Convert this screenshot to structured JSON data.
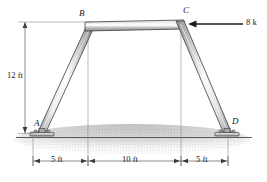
{
  "figure": {
    "joints": [
      {
        "id": "A",
        "label": "A",
        "x": 41,
        "y": 133
      },
      {
        "id": "B",
        "label": "B",
        "x": 88,
        "y": 24
      },
      {
        "id": "C",
        "label": "C",
        "x": 181,
        "y": 22
      },
      {
        "id": "D",
        "label": "D",
        "x": 228,
        "y": 133
      }
    ],
    "load": {
      "label": "8 k",
      "magnitude": 8,
      "unit": "k",
      "direction": "left",
      "applied_at": "C",
      "arrow_tail_x": 243,
      "arrow_tip_x": 190,
      "arrow_y": 24
    },
    "dimensions": {
      "height": {
        "label": "12 ft",
        "value": 12,
        "unit": "ft",
        "x": 25,
        "y_top": 22,
        "y_bottom": 133
      },
      "spans": [
        {
          "label": "5 ft",
          "value": 5,
          "unit": "ft",
          "x_start": 33,
          "x_end": 88
        },
        {
          "label": "10 ft",
          "value": 10,
          "unit": "ft",
          "x_start": 88,
          "x_end": 181
        },
        {
          "label": "5 ft",
          "value": 5,
          "unit": "ft",
          "x_start": 181,
          "x_end": 228
        }
      ],
      "baseline_y": 161
    },
    "supports": [
      {
        "at": "A",
        "type": "pin-base-plate"
      },
      {
        "at": "D",
        "type": "pin-base-plate"
      }
    ],
    "ground": {
      "y": 137,
      "style": "stippled-soil"
    },
    "colors": {
      "member_light": "#f2f2f2",
      "member_mid": "#b9b9b9",
      "member_dark": "#7d7d7d",
      "outline": "#3c3c3c",
      "dimension_line": "#5a5a5a",
      "text": "#1a1a1a",
      "ground_fill": "#c9c9c9"
    }
  }
}
